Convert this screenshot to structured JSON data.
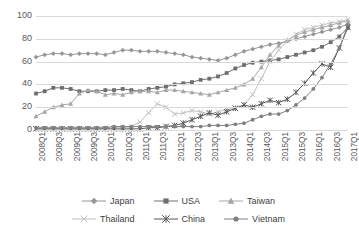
{
  "chart_data": {
    "type": "line",
    "title": "",
    "xlabel": "",
    "ylabel": "",
    "ylim": [
      0,
      100
    ],
    "yticks": [
      0,
      20,
      40,
      60,
      80,
      100
    ],
    "grid": true,
    "legend_position": "bottom",
    "x": [
      "2008Q1",
      "2008Q2",
      "2008Q3",
      "2008Q4",
      "2009Q1",
      "2009Q2",
      "2009Q3",
      "2009Q4",
      "2010Q1",
      "2010Q2",
      "2010Q3",
      "2010Q4",
      "2011Q1",
      "2011Q2",
      "2011Q3",
      "2011Q4",
      "2012Q1",
      "2012Q2",
      "2012Q3",
      "2012Q4",
      "2013Q1",
      "2013Q2",
      "2013Q3",
      "2013Q4",
      "2014Q1",
      "2014Q2",
      "2014Q3",
      "2014Q4",
      "2015Q1",
      "2015Q2",
      "2015Q3",
      "2015Q4",
      "2016Q1",
      "2016Q2",
      "2016Q3",
      "2016Q4",
      "2017Q1"
    ],
    "xtick_labels": [
      "2008Q1",
      "2008Q3",
      "2009Q1",
      "2009Q3",
      "2010Q1",
      "2010Q3",
      "2011Q1",
      "2011Q3",
      "2012Q1",
      "2012Q3",
      "2013Q1",
      "2013Q3",
      "2014Q1",
      "2014Q3",
      "2015Q1",
      "2015Q3",
      "2016Q1",
      "2016Q3",
      "2017Q1"
    ],
    "series": [
      {
        "name": "Japan",
        "marker": "diamond",
        "color": "#969696",
        "values": [
          64,
          66,
          67,
          67,
          66,
          67,
          67,
          67,
          66,
          68,
          70,
          70,
          69,
          69,
          69,
          68,
          67,
          66,
          64,
          63,
          62,
          61,
          63,
          66,
          69,
          71,
          73,
          75,
          76,
          78,
          80,
          82,
          84,
          86,
          88,
          90,
          93
        ]
      },
      {
        "name": "USA",
        "marker": "square",
        "color": "#6E6E6E",
        "values": [
          32,
          34,
          37,
          37,
          36,
          34,
          34,
          34,
          35,
          35,
          36,
          35,
          34,
          36,
          37,
          38,
          40,
          41,
          42,
          44,
          45,
          47,
          50,
          54,
          57,
          59,
          60,
          61,
          62,
          64,
          66,
          68,
          70,
          73,
          77,
          82,
          90
        ]
      },
      {
        "name": "Taiwan",
        "marker": "triangle",
        "color": "#A6A6A6",
        "values": [
          12,
          16,
          20,
          22,
          23,
          32,
          35,
          34,
          31,
          32,
          31,
          33,
          34,
          34,
          33,
          35,
          35,
          34,
          33,
          32,
          31,
          33,
          35,
          37,
          40,
          45,
          55,
          66,
          74,
          79,
          83,
          86,
          88,
          90,
          92,
          94,
          96
        ]
      },
      {
        "name": "Thailand",
        "marker": "cross",
        "color": "#BFBFBF",
        "values": [
          1,
          1,
          1,
          1,
          1,
          1,
          1,
          1,
          1,
          2,
          2,
          3,
          7,
          15,
          23,
          20,
          14,
          15,
          17,
          16,
          14,
          16,
          18,
          19,
          22,
          31,
          45,
          60,
          70,
          78,
          84,
          88,
          90,
          92,
          94,
          95,
          97
        ]
      },
      {
        "name": "China",
        "marker": "star",
        "color": "#595959",
        "values": [
          1,
          1,
          1,
          1,
          1,
          1,
          1,
          1,
          1,
          1,
          1,
          1,
          1,
          2,
          2,
          3,
          4,
          6,
          9,
          12,
          15,
          13,
          16,
          19,
          22,
          20,
          23,
          26,
          24,
          27,
          33,
          41,
          50,
          58,
          55,
          72,
          90
        ]
      },
      {
        "name": "Vietnam",
        "marker": "circle",
        "color": "#808080",
        "values": [
          2,
          2,
          2,
          2,
          2,
          2,
          2,
          2,
          2,
          3,
          3,
          3,
          3,
          3,
          3,
          3,
          3,
          3,
          3,
          3,
          4,
          4,
          4,
          5,
          6,
          9,
          12,
          14,
          14,
          17,
          22,
          28,
          36,
          46,
          58,
          72,
          92
        ]
      }
    ]
  },
  "legend": {
    "rows": [
      [
        {
          "label": "Japan",
          "marker": "diamond",
          "color": "#969696"
        },
        {
          "label": "USA",
          "marker": "square",
          "color": "#6E6E6E"
        },
        {
          "label": "Taiwan",
          "marker": "triangle",
          "color": "#A6A6A6"
        }
      ],
      [
        {
          "label": "Thailand",
          "marker": "cross",
          "color": "#BFBFBF"
        },
        {
          "label": "China",
          "marker": "star",
          "color": "#595959"
        },
        {
          "label": "Vietnam",
          "marker": "circle",
          "color": "#808080"
        }
      ]
    ]
  },
  "axes": {
    "grid_color": "#D9D9D9",
    "tick_text_color": "#595959"
  }
}
